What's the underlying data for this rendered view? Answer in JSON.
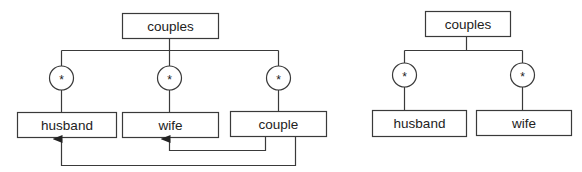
{
  "diagrams": [
    {
      "id": "left",
      "root": {
        "label": "couples"
      },
      "children": [
        {
          "label": "husband",
          "multiplicity": "*"
        },
        {
          "label": "wife",
          "multiplicity": "*"
        },
        {
          "label": "couple",
          "multiplicity": "*"
        }
      ],
      "references": [
        {
          "from": "couple",
          "to": "wife"
        },
        {
          "from": "couple",
          "to": "husband"
        }
      ]
    },
    {
      "id": "right",
      "root": {
        "label": "couples"
      },
      "children": [
        {
          "label": "husband",
          "multiplicity": "*"
        },
        {
          "label": "wife",
          "multiplicity": "*"
        }
      ]
    }
  ],
  "colors": {
    "line": "#3a3a3a",
    "text": "#222222",
    "background": "#ffffff"
  }
}
